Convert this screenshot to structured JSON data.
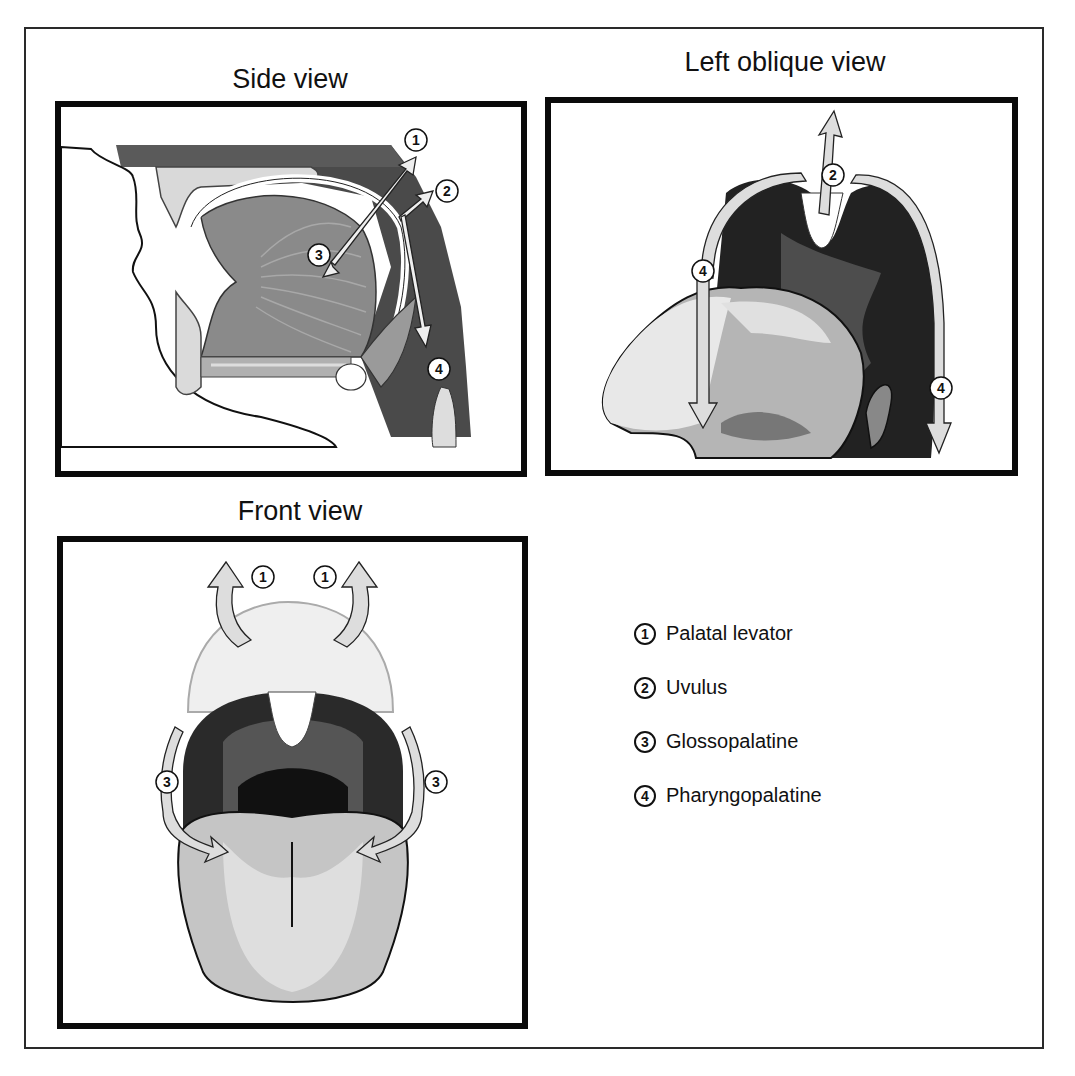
{
  "figure": {
    "panels": [
      {
        "id": "side",
        "title": "Side view",
        "markers": [
          "1",
          "2",
          "3",
          "4"
        ]
      },
      {
        "id": "oblique",
        "title": "Left oblique view",
        "markers": [
          "2",
          "4",
          "4"
        ]
      },
      {
        "id": "front",
        "title": "Front view",
        "markers": [
          "1",
          "1",
          "3",
          "3"
        ]
      }
    ],
    "legend": [
      {
        "num": "1",
        "label": "Palatal levator"
      },
      {
        "num": "2",
        "label": "Uvulus"
      },
      {
        "num": "3",
        "label": "Glossopalatine"
      },
      {
        "num": "4",
        "label": "Pharyngopalatine"
      }
    ]
  },
  "colors": {
    "border": "#0a0a0a",
    "dark_tissue": "#3a3a3a",
    "mid_tissue": "#808080",
    "light_tissue": "#cfcfcf",
    "arrow_fill": "#d8d8d8"
  }
}
